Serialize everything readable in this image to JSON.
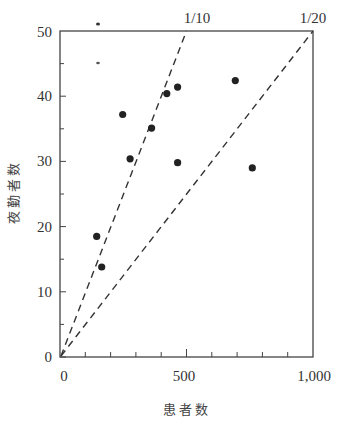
{
  "chart_data": {
    "type": "scatter",
    "title": "",
    "xlabel": "患者数",
    "ylabel": "夜勤者数",
    "xlim": [
      0,
      1000
    ],
    "ylim": [
      0,
      50
    ],
    "x_ticks_major": [
      0,
      500,
      1000
    ],
    "x_tick_labels": [
      "0",
      "500",
      "1,000"
    ],
    "x_ticks_minor": [
      100,
      200,
      300,
      400,
      600,
      700,
      800,
      900
    ],
    "y_ticks_major": [
      0,
      10,
      20,
      30,
      40,
      50
    ],
    "y_tick_labels": [
      "0",
      "10",
      "20",
      "30",
      "40",
      "50"
    ],
    "y_ticks_minor": [
      5,
      15,
      25,
      35,
      45
    ],
    "grid": false,
    "legend": null,
    "series": [
      {
        "name": "施設",
        "points": [
          {
            "x": 145,
            "y": 18.5
          },
          {
            "x": 165,
            "y": 13.8
          },
          {
            "x": 248,
            "y": 37.2
          },
          {
            "x": 277,
            "y": 30.4
          },
          {
            "x": 362,
            "y": 35.1
          },
          {
            "x": 422,
            "y": 40.4
          },
          {
            "x": 465,
            "y": 41.4
          },
          {
            "x": 465,
            "y": 29.8
          },
          {
            "x": 693,
            "y": 42.4
          },
          {
            "x": 760,
            "y": 29.0
          }
        ]
      }
    ],
    "reference_lines": [
      {
        "label": "1/10",
        "slope": 0.1,
        "style": "dashed",
        "from": [
          0,
          0
        ],
        "to": [
          500,
          50
        ]
      },
      {
        "label": "1/20",
        "slope": 0.05,
        "style": "dashed",
        "from": [
          0,
          0
        ],
        "to": [
          1000,
          50
        ]
      }
    ],
    "annotations": [
      "1/10",
      "1/20"
    ]
  },
  "labels": {
    "xlabel": "患者数",
    "ylabel": "夜勤者数",
    "ratio_1": "1/10",
    "ratio_2": "1/20",
    "x0": "0",
    "x500": "500",
    "x1000": "1,000",
    "y0": "0",
    "y10": "10",
    "y20": "20",
    "y30": "30",
    "y40": "40",
    "y50": "50"
  }
}
